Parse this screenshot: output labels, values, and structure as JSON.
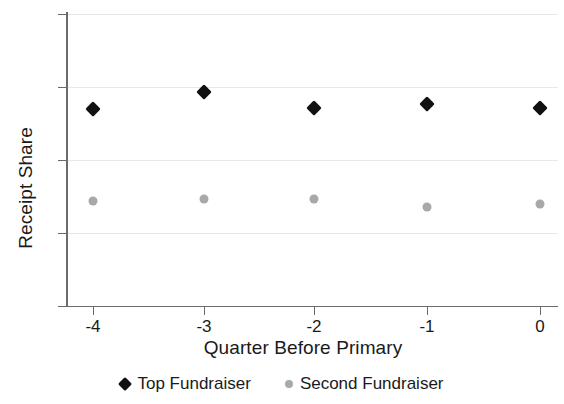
{
  "chart_data": {
    "type": "scatter",
    "title": "",
    "xlabel": "Quarter Before Primary",
    "ylabel": "Receipt Share",
    "categories": [
      "-4",
      "-3",
      "-2",
      "-1",
      "0"
    ],
    "x": [
      -4,
      -3,
      -2,
      -1,
      0
    ],
    "xlim": [
      -4.5,
      0.5
    ],
    "ylim": [
      0,
      0.8
    ],
    "grid": true,
    "legend_position": "bottom",
    "y_ticks": [
      "0",
      ".2",
      ".4",
      ".6",
      ".8"
    ],
    "y_tick_values": [
      0,
      0.2,
      0.4,
      0.6,
      0.8
    ],
    "x_ticks": [
      "-4",
      "-3",
      "-2",
      "-1",
      "0"
    ],
    "series": [
      {
        "name": "Top Fundraiser",
        "marker": "diamond",
        "color": "#111111",
        "values": [
          0.538,
          0.585,
          0.542,
          0.553,
          0.541
        ]
      },
      {
        "name": "Second Fundraiser",
        "marker": "circle",
        "color": "#a8a8a8",
        "values": [
          0.286,
          0.292,
          0.292,
          0.27,
          0.279
        ]
      }
    ]
  },
  "legend": {
    "entries": [
      {
        "label": "Top Fundraiser"
      },
      {
        "label": "Second Fundraiser"
      }
    ]
  }
}
